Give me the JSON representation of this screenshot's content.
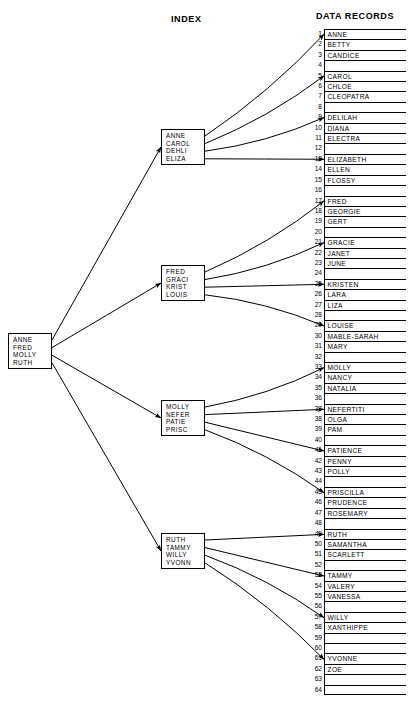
{
  "headers": {
    "index": "INDEX",
    "records": "DATA RECORDS"
  },
  "diagram": {
    "type": "index-tree",
    "root": {
      "name": "root-index-node",
      "keys": [
        "ANNE",
        "FRED",
        "MOLLY",
        "RUTH"
      ]
    },
    "index_nodes": [
      {
        "name": "index-node-a",
        "keys": [
          "ANNE",
          "CAROL",
          "DEHLI",
          "ELIZA"
        ]
      },
      {
        "name": "index-node-b",
        "keys": [
          "FRED",
          "GRACI",
          "KRIST",
          "LOUIS"
        ]
      },
      {
        "name": "index-node-c",
        "keys": [
          "MOLLY",
          "NEFER",
          "PATIE",
          "PRISC"
        ]
      },
      {
        "name": "index-node-d",
        "keys": [
          "RUTH",
          "TAMMY",
          "WILLY",
          "YVONN"
        ]
      }
    ],
    "root_targets": [
      "index-node-a",
      "index-node-b",
      "index-node-c",
      "index-node-d"
    ],
    "key_targets": [
      {
        "node": "index-node-a",
        "key": "ANNE",
        "record": 1
      },
      {
        "node": "index-node-a",
        "key": "CAROL",
        "record": 5
      },
      {
        "node": "index-node-a",
        "key": "DEHLI",
        "record": 9
      },
      {
        "node": "index-node-a",
        "key": "ELIZA",
        "record": 13
      },
      {
        "node": "index-node-b",
        "key": "FRED",
        "record": 17
      },
      {
        "node": "index-node-b",
        "key": "GRACI",
        "record": 21
      },
      {
        "node": "index-node-b",
        "key": "KRIST",
        "record": 25
      },
      {
        "node": "index-node-b",
        "key": "LOUIS",
        "record": 29
      },
      {
        "node": "index-node-c",
        "key": "MOLLY",
        "record": 33
      },
      {
        "node": "index-node-c",
        "key": "NEFER",
        "record": 37
      },
      {
        "node": "index-node-c",
        "key": "PATIE",
        "record": 41
      },
      {
        "node": "index-node-c",
        "key": "PRISC",
        "record": 45
      },
      {
        "node": "index-node-d",
        "key": "RUTH",
        "record": 49
      },
      {
        "node": "index-node-d",
        "key": "TAMMY",
        "record": 53
      },
      {
        "node": "index-node-d",
        "key": "WILLY",
        "record": 57
      },
      {
        "node": "index-node-d",
        "key": "YVONN",
        "record": 61
      }
    ]
  },
  "records": [
    {
      "n": 1,
      "name": "ANNE"
    },
    {
      "n": 2,
      "name": "BETTY"
    },
    {
      "n": 3,
      "name": "CANDICE"
    },
    {
      "n": 4,
      "name": ""
    },
    {
      "n": 5,
      "name": "CAROL"
    },
    {
      "n": 6,
      "name": "CHLOE"
    },
    {
      "n": 7,
      "name": "CLEOPATRA"
    },
    {
      "n": 8,
      "name": ""
    },
    {
      "n": 9,
      "name": "DELILAH"
    },
    {
      "n": 10,
      "name": "DIANA"
    },
    {
      "n": 11,
      "name": "ELECTRA"
    },
    {
      "n": 12,
      "name": ""
    },
    {
      "n": 13,
      "name": "ELIZABETH"
    },
    {
      "n": 14,
      "name": "ELLEN"
    },
    {
      "n": 15,
      "name": "FLOSSY"
    },
    {
      "n": 16,
      "name": ""
    },
    {
      "n": 17,
      "name": "FRED"
    },
    {
      "n": 18,
      "name": "GEORGIE"
    },
    {
      "n": 19,
      "name": "GERT"
    },
    {
      "n": 20,
      "name": ""
    },
    {
      "n": 21,
      "name": "GRACIE"
    },
    {
      "n": 22,
      "name": "JANET"
    },
    {
      "n": 23,
      "name": "JUNE"
    },
    {
      "n": 24,
      "name": ""
    },
    {
      "n": 25,
      "name": "KRISTEN"
    },
    {
      "n": 26,
      "name": "LARA"
    },
    {
      "n": 27,
      "name": "LIZA"
    },
    {
      "n": 28,
      "name": ""
    },
    {
      "n": 29,
      "name": "LOUISE"
    },
    {
      "n": 30,
      "name": "MABLE-SARAH"
    },
    {
      "n": 31,
      "name": "MARY"
    },
    {
      "n": 32,
      "name": ""
    },
    {
      "n": 33,
      "name": "MOLLY"
    },
    {
      "n": 34,
      "name": "NANCY"
    },
    {
      "n": 35,
      "name": "NATALIA"
    },
    {
      "n": 36,
      "name": ""
    },
    {
      "n": 37,
      "name": "NEFERTITI"
    },
    {
      "n": 38,
      "name": "OLGA"
    },
    {
      "n": 39,
      "name": "PAM"
    },
    {
      "n": 40,
      "name": ""
    },
    {
      "n": 41,
      "name": "PATIENCE"
    },
    {
      "n": 42,
      "name": "PENNY"
    },
    {
      "n": 43,
      "name": "POLLY"
    },
    {
      "n": 44,
      "name": ""
    },
    {
      "n": 45,
      "name": "PRISCILLA"
    },
    {
      "n": 46,
      "name": "PRUDENCE"
    },
    {
      "n": 47,
      "name": "ROSEMARY"
    },
    {
      "n": 48,
      "name": ""
    },
    {
      "n": 49,
      "name": "RUTH"
    },
    {
      "n": 50,
      "name": "SAMANTHA"
    },
    {
      "n": 51,
      "name": "SCARLETT"
    },
    {
      "n": 52,
      "name": ""
    },
    {
      "n": 53,
      "name": "TAMMY"
    },
    {
      "n": 54,
      "name": "VALERY"
    },
    {
      "n": 55,
      "name": "VANESSA"
    },
    {
      "n": 56,
      "name": ""
    },
    {
      "n": 57,
      "name": "WILLY"
    },
    {
      "n": 58,
      "name": "XANTHIPPE"
    },
    {
      "n": 59,
      "name": ""
    },
    {
      "n": 60,
      "name": ""
    },
    {
      "n": 61,
      "name": "YVONNE"
    },
    {
      "n": 62,
      "name": "ZOE"
    },
    {
      "n": 63,
      "name": ""
    },
    {
      "n": 64,
      "name": ""
    }
  ],
  "colors": {
    "ink": "#000000",
    "paper": "#ffffff"
  }
}
